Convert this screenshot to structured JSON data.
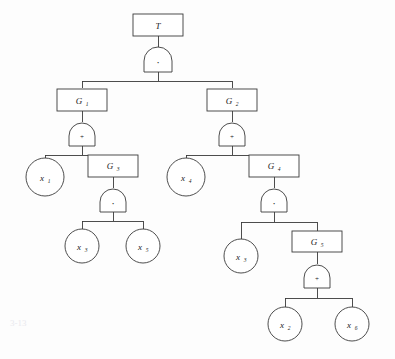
{
  "diagram": {
    "type": "fault-tree",
    "title_node": {
      "label": "T",
      "shape": "rect"
    },
    "gate_symbols": {
      "and": "·",
      "or": "+"
    },
    "nodes": [
      {
        "id": "T",
        "label": "T",
        "sub": "",
        "shape": "rect",
        "x": 158,
        "y": 25,
        "gate": "·"
      },
      {
        "id": "G1",
        "label": "G",
        "sub": "1",
        "shape": "rect",
        "x": 82,
        "y": 100,
        "gate": "+"
      },
      {
        "id": "G2",
        "label": "G",
        "sub": "2",
        "shape": "rect",
        "x": 232,
        "y": 100,
        "gate": "+"
      },
      {
        "id": "x1",
        "label": "x",
        "sub": "1",
        "shape": "circle",
        "x": 45,
        "y": 177,
        "gate": ""
      },
      {
        "id": "G3",
        "label": "G",
        "sub": "3",
        "shape": "rect",
        "x": 113,
        "y": 165,
        "gate": "·"
      },
      {
        "id": "x4",
        "label": "x",
        "sub": "4",
        "shape": "circle",
        "x": 186,
        "y": 177,
        "gate": ""
      },
      {
        "id": "G4",
        "label": "G",
        "sub": "4",
        "shape": "rect",
        "x": 274,
        "y": 165,
        "gate": "·"
      },
      {
        "id": "x3a",
        "label": "x",
        "sub": "3",
        "shape": "circle",
        "x": 82,
        "y": 243,
        "gate": ""
      },
      {
        "id": "x5a",
        "label": "x",
        "sub": "5",
        "shape": "circle",
        "x": 143,
        "y": 243,
        "gate": ""
      },
      {
        "id": "x3b",
        "label": "x",
        "sub": "3",
        "shape": "circle",
        "x": 241,
        "y": 253,
        "gate": ""
      },
      {
        "id": "G5",
        "label": "G",
        "sub": "5",
        "shape": "rect",
        "x": 317,
        "y": 241,
        "gate": "+"
      },
      {
        "id": "x2",
        "label": "x",
        "sub": "2",
        "shape": "circle",
        "x": 285,
        "y": 321,
        "gate": ""
      },
      {
        "id": "x6",
        "label": "x",
        "sub": "6",
        "shape": "circle",
        "x": 352,
        "y": 321,
        "gate": ""
      }
    ],
    "edges": [
      {
        "from": "T",
        "to": "G1"
      },
      {
        "from": "T",
        "to": "G2"
      },
      {
        "from": "G1",
        "to": "x1"
      },
      {
        "from": "G1",
        "to": "G3"
      },
      {
        "from": "G2",
        "to": "x4"
      },
      {
        "from": "G2",
        "to": "G4"
      },
      {
        "from": "G3",
        "to": "x3a"
      },
      {
        "from": "G3",
        "to": "x5a"
      },
      {
        "from": "G4",
        "to": "x3b"
      },
      {
        "from": "G4",
        "to": "G5"
      },
      {
        "from": "G5",
        "to": "x2"
      },
      {
        "from": "G5",
        "to": "x6"
      }
    ],
    "colors": {
      "stroke": "#3a3a3a",
      "fill": "#ffffff",
      "background": "#fdfdfd",
      "text": "#1a1a1a"
    },
    "artifact_text": "3-13"
  }
}
